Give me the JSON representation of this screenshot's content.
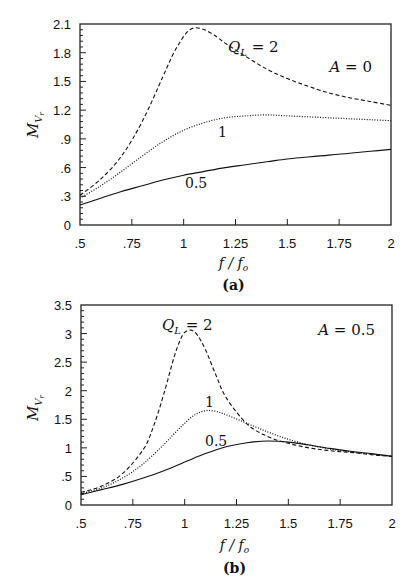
{
  "chart_data": [
    {
      "panel": "(a)",
      "type": "line",
      "annotation": "A = 0",
      "xlabel": "f / f_o",
      "ylabel": "M_Vr",
      "xlim": [
        0.5,
        2
      ],
      "ylim": [
        0,
        2.1
      ],
      "xticks": [
        ".5",
        ".75",
        "1",
        "1.25",
        "1.5",
        "1.75",
        "2"
      ],
      "yticks": [
        "0",
        ".3",
        ".6",
        ".9",
        "1.2",
        "1.5",
        "1.8",
        "2.1"
      ],
      "grid": false,
      "legend": "inline curve labels",
      "series": [
        {
          "name": "Q_L = 2",
          "style": "dashed",
          "x": [
            0.5,
            0.6,
            0.7,
            0.8,
            0.9,
            0.95,
            1.0,
            1.03,
            1.06,
            1.1,
            1.15,
            1.2,
            1.3,
            1.4,
            1.5,
            1.6,
            1.7,
            1.8,
            1.9,
            2.0
          ],
          "y": [
            0.31,
            0.48,
            0.72,
            1.08,
            1.55,
            1.79,
            1.97,
            2.04,
            2.06,
            2.04,
            1.98,
            1.9,
            1.76,
            1.63,
            1.53,
            1.45,
            1.38,
            1.33,
            1.29,
            1.25
          ]
        },
        {
          "name": "1",
          "style": "dotted",
          "x": [
            0.5,
            0.6,
            0.7,
            0.8,
            0.9,
            1.0,
            1.1,
            1.2,
            1.3,
            1.4,
            1.5,
            1.6,
            1.7,
            1.8,
            1.9,
            2.0
          ],
          "y": [
            0.28,
            0.41,
            0.56,
            0.72,
            0.87,
            0.99,
            1.07,
            1.12,
            1.14,
            1.15,
            1.14,
            1.13,
            1.12,
            1.11,
            1.1,
            1.09
          ]
        },
        {
          "name": "0.5",
          "style": "solid",
          "x": [
            0.5,
            0.6,
            0.7,
            0.8,
            0.9,
            1.0,
            1.1,
            1.2,
            1.3,
            1.4,
            1.5,
            1.6,
            1.7,
            1.8,
            1.9,
            2.0
          ],
          "y": [
            0.21,
            0.28,
            0.35,
            0.41,
            0.47,
            0.52,
            0.56,
            0.6,
            0.63,
            0.66,
            0.69,
            0.71,
            0.73,
            0.75,
            0.77,
            0.79
          ]
        }
      ],
      "curve_labels": [
        {
          "text": "Q_L = 2",
          "x": 1.06,
          "y": 2.0
        },
        {
          "text": "1",
          "x": 1.1,
          "y": 1.22
        },
        {
          "text": "0.5",
          "x": 1.0,
          "y": 0.67
        }
      ]
    },
    {
      "panel": "(b)",
      "type": "line",
      "annotation": "A = 0.5",
      "xlabel": "f / f_o",
      "ylabel": "M_Vr",
      "xlim": [
        0.5,
        2
      ],
      "ylim": [
        0,
        3.5
      ],
      "xticks": [
        ".5",
        ".75",
        "1",
        "1.25",
        "1.5",
        "1.75",
        "2"
      ],
      "yticks": [
        "0",
        ".5",
        "1",
        "1.5",
        "2",
        "2.5",
        "3",
        "3.5"
      ],
      "grid": false,
      "legend": "inline curve labels",
      "series": [
        {
          "name": "Q_L = 2",
          "style": "dashed",
          "x": [
            0.5,
            0.6,
            0.7,
            0.8,
            0.85,
            0.9,
            0.95,
            0.98,
            1.0,
            1.03,
            1.06,
            1.1,
            1.15,
            1.2,
            1.3,
            1.4,
            1.5,
            1.6,
            1.7,
            1.8,
            1.9,
            2.0
          ],
          "y": [
            0.22,
            0.33,
            0.55,
            0.97,
            1.38,
            1.95,
            2.6,
            2.9,
            3.02,
            3.06,
            2.98,
            2.72,
            2.28,
            1.88,
            1.42,
            1.2,
            1.08,
            1.0,
            0.95,
            0.92,
            0.88,
            0.85
          ]
        },
        {
          "name": "1",
          "style": "dotted",
          "x": [
            0.5,
            0.6,
            0.7,
            0.8,
            0.9,
            0.95,
            1.0,
            1.05,
            1.1,
            1.15,
            1.2,
            1.3,
            1.4,
            1.5,
            1.6,
            1.7,
            1.8,
            1.9,
            2.0
          ],
          "y": [
            0.2,
            0.3,
            0.47,
            0.72,
            1.06,
            1.25,
            1.43,
            1.58,
            1.65,
            1.64,
            1.58,
            1.43,
            1.28,
            1.15,
            1.05,
            0.98,
            0.93,
            0.89,
            0.86
          ]
        },
        {
          "name": "0.5",
          "style": "solid",
          "x": [
            0.5,
            0.6,
            0.7,
            0.8,
            0.9,
            1.0,
            1.1,
            1.2,
            1.3,
            1.4,
            1.5,
            1.6,
            1.7,
            1.8,
            1.9,
            2.0
          ],
          "y": [
            0.18,
            0.27,
            0.36,
            0.47,
            0.6,
            0.75,
            0.9,
            1.02,
            1.09,
            1.12,
            1.1,
            1.05,
            0.99,
            0.94,
            0.9,
            0.85
          ]
        }
      ],
      "curve_labels": [
        {
          "text": "Q_L = 2",
          "x": 0.78,
          "y": 3.3
        },
        {
          "text": "1",
          "x": 1.06,
          "y": 1.8
        },
        {
          "text": "0.5",
          "x": 1.08,
          "y": 1.2
        }
      ]
    }
  ],
  "captions": [
    "(a)",
    "(b)"
  ],
  "xlabel_text": "f / f",
  "xlabel_sub": "o",
  "ylabel_main": "M",
  "ylabel_sub": "V",
  "ylabel_subsub": "r",
  "ql_main": "Q",
  "ql_sub": "L",
  "ql_eq": " = 2"
}
